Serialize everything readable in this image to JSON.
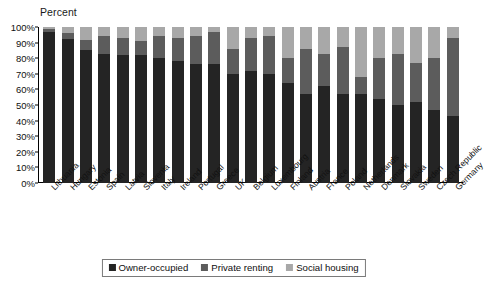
{
  "chart_data": {
    "type": "bar",
    "subtype": "stacked-100-percent",
    "title": "",
    "ylabel": "Percent",
    "xlabel": "",
    "ylim": [
      0,
      100
    ],
    "ytick_labels": [
      "0%",
      "10%",
      "20%",
      "30%",
      "40%",
      "50%",
      "60%",
      "70%",
      "80%",
      "90%",
      "100%"
    ],
    "ytick_values": [
      0,
      10,
      20,
      30,
      40,
      50,
      60,
      70,
      80,
      90,
      100
    ],
    "grid": false,
    "legend_position": "bottom-center",
    "categories": [
      "Lithuania",
      "Hungary",
      "Estonia",
      "Spain",
      "Latvia",
      "Slovenia",
      "Italy",
      "Ireland",
      "Portugal",
      "Greece",
      "UK",
      "Belgium",
      "Luxembourg",
      "Finland",
      "Austria",
      "France",
      "Poland",
      "Netherlands",
      "Denmark",
      "Slovakia",
      "Sweden",
      "Czech Republic",
      "Germany"
    ],
    "series": [
      {
        "name": "Owner-occupied",
        "color": "#242424",
        "values": [
          97,
          92,
          85,
          83,
          82,
          82,
          80,
          78,
          76,
          76,
          70,
          72,
          70,
          64,
          57,
          62,
          57,
          57,
          54,
          50,
          52,
          47,
          43
        ]
      },
      {
        "name": "Private renting",
        "color": "#5c5c5c",
        "values": [
          2,
          4,
          7,
          11,
          11,
          9,
          14,
          15,
          18,
          21,
          16,
          21,
          24,
          16,
          29,
          21,
          30,
          11,
          26,
          33,
          25,
          33,
          50
        ]
      },
      {
        "name": "Social housing",
        "color": "#a8a8a8",
        "values": [
          1,
          4,
          8,
          6,
          7,
          9,
          6,
          7,
          6,
          3,
          14,
          7,
          6,
          20,
          14,
          17,
          13,
          32,
          20,
          17,
          23,
          20,
          7
        ]
      }
    ]
  },
  "legend": {
    "items": [
      {
        "label": "Owner-occupied",
        "color": "#242424"
      },
      {
        "label": "Private renting",
        "color": "#5c5c5c"
      },
      {
        "label": "Social housing",
        "color": "#a8a8a8"
      }
    ]
  }
}
